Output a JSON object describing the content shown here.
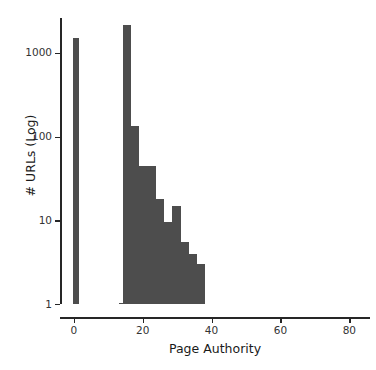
{
  "chart_data": {
    "type": "bar",
    "title": "",
    "subtitle": "",
    "xlabel": "Page Authority",
    "ylabel": "# URLs (Log)",
    "yscale": "log",
    "xlim": [
      -4,
      86
    ],
    "ylim": [
      1,
      2600
    ],
    "grid": false,
    "legend": null,
    "bar_color": "#4d4d4d",
    "axis_color": "#262626",
    "xticks": [
      0,
      20,
      40,
      60,
      80
    ],
    "xtick_labels": [
      "0",
      "20",
      "40",
      "60",
      "80"
    ],
    "yticks": [
      1,
      10,
      100,
      1000
    ],
    "ytick_labels": [
      "1",
      "10",
      "100",
      "1000"
    ],
    "bin_width": 2.4,
    "bins": [
      {
        "x0": -0.2,
        "x1": 1.6,
        "value": 1500
      },
      {
        "x0": 13.0,
        "x1": 14.2,
        "value": 1.0
      },
      {
        "x0": 14.2,
        "x1": 16.6,
        "value": 2150
      },
      {
        "x0": 16.6,
        "x1": 19.0,
        "value": 135
      },
      {
        "x0": 19.0,
        "x1": 21.4,
        "value": 44
      },
      {
        "x0": 21.4,
        "x1": 23.8,
        "value": 44
      },
      {
        "x0": 23.8,
        "x1": 26.2,
        "value": 18
      },
      {
        "x0": 26.2,
        "x1": 28.6,
        "value": 9.5
      },
      {
        "x0": 28.6,
        "x1": 31.0,
        "value": 15
      },
      {
        "x0": 31.0,
        "x1": 33.4,
        "value": 5.5
      },
      {
        "x0": 33.4,
        "x1": 35.8,
        "value": 4
      },
      {
        "x0": 35.8,
        "x1": 38.2,
        "value": 3
      }
    ]
  }
}
